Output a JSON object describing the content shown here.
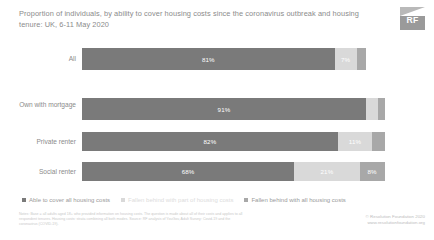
{
  "title": "Proportion of individuals, by ability to cover housing costs since the coronavirus outbreak and housing tenure: UK, 6-11 May 2020",
  "logo": {
    "text": "RF",
    "name": "resolution-foundation-logo"
  },
  "legend": [
    {
      "label": "Able to cover all housing costs",
      "color": "#7a7a7a"
    },
    {
      "label": "Fallen behind with part of housing costs",
      "color": "#d9d9d9"
    },
    {
      "label": "Fallen behind with all housing costs",
      "color": "#a8a8a8"
    }
  ],
  "notes": "Notes: Base = all adults aged 18+ who provided information on housing costs. The question is made about all of their costs and applies to all respondent tenures. Housing costs: strata combining all both modes. Source: RF analysis of YouGov, Adult Survey: Covid-19 and the coronavirus (COVID-19).",
  "credit_line1": "© Resolution Foundation 2020",
  "credit_line2": "www.resolutionfoundation.org",
  "chart_data": {
    "type": "bar",
    "orientation": "horizontal",
    "stacked": true,
    "title": "Proportion of individuals, by ability to cover housing costs since the coronavirus outbreak and housing tenure: UK, 6-11 May 2020",
    "xlabel": "",
    "ylabel": "",
    "xlim": [
      0,
      100
    ],
    "grid": false,
    "legend_position": "bottom",
    "categories": [
      "All",
      "Own with mortgage",
      "Private renter",
      "Social renter"
    ],
    "series": [
      {
        "name": "Able to cover all housing costs",
        "color": "#7a7a7a",
        "values": [
          81,
          91,
          82,
          68
        ],
        "labels": [
          "81%",
          "91%",
          "82%",
          "68%"
        ]
      },
      {
        "name": "Fallen behind with part of housing costs",
        "color": "#d9d9d9",
        "values": [
          7,
          4,
          11,
          21
        ],
        "labels": [
          "7%",
          "4%",
          "11%",
          "21%"
        ]
      },
      {
        "name": "Fallen behind with all housing costs",
        "color": "#a8a8a8",
        "values": [
          3,
          2,
          4,
          8
        ],
        "labels": [
          "3%",
          "2%",
          "4%",
          "8%"
        ]
      }
    ],
    "rows": [
      {
        "label": "All",
        "segments": [
          {
            "value": 81,
            "label": "81%",
            "color": "#7a7a7a"
          },
          {
            "value": 7,
            "label": "7%",
            "color": "#d9d9d9"
          },
          {
            "value": 3,
            "label": "3%",
            "color": "#a8a8a8"
          }
        ]
      },
      {
        "label": "Own with mortgage",
        "segments": [
          {
            "value": 91,
            "label": "91%",
            "color": "#7a7a7a"
          },
          {
            "value": 4,
            "label": "4%",
            "color": "#d9d9d9"
          },
          {
            "value": 2,
            "label": "2%",
            "color": "#a8a8a8"
          }
        ]
      },
      {
        "label": "Private renter",
        "segments": [
          {
            "value": 82,
            "label": "82%",
            "color": "#7a7a7a"
          },
          {
            "value": 11,
            "label": "11%",
            "color": "#d9d9d9"
          },
          {
            "value": 4,
            "label": "4%",
            "color": "#a8a8a8"
          }
        ]
      },
      {
        "label": "Social renter",
        "segments": [
          {
            "value": 68,
            "label": "68%",
            "color": "#7a7a7a"
          },
          {
            "value": 21,
            "label": "21%",
            "color": "#d9d9d9"
          },
          {
            "value": 8,
            "label": "8%",
            "color": "#a8a8a8"
          }
        ]
      }
    ]
  }
}
